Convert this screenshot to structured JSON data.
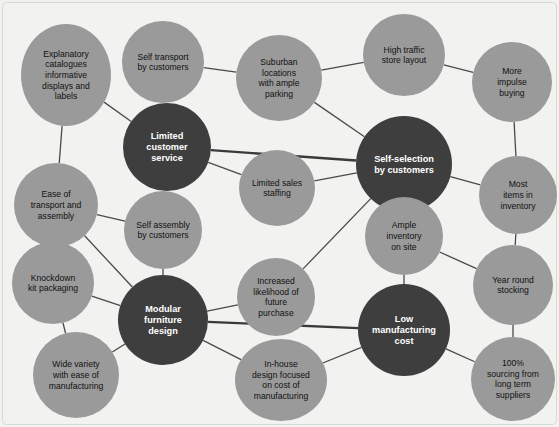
{
  "diagram": {
    "type": "node-link-network",
    "background_color": "#f2f2f0",
    "light_node_color": "#9a9a9a",
    "dark_node_color": "#3e3e3e",
    "light_node_text_color": "#111111",
    "dark_node_text_color": "#ffffff",
    "edge_color": "#4a4a4a",
    "width": 559,
    "height": 427,
    "nodes": [
      {
        "id": "explanatory-catalogues",
        "label": "Explanatory catalogues informative displays and labels",
        "lines": [
          "Explanatory",
          "catalogues",
          "informative",
          "displays and",
          "labels"
        ],
        "kind": "light",
        "shape": "ellipse",
        "cx": 66,
        "cy": 75,
        "rx": 45,
        "ry": 51
      },
      {
        "id": "self-transport",
        "label": "Self transport by customers",
        "lines": [
          "Self transport",
          "by customers"
        ],
        "kind": "light",
        "shape": "circle",
        "cx": 163,
        "cy": 62,
        "rx": 41,
        "ry": 41
      },
      {
        "id": "suburban-locations",
        "label": "Suburban locations with ample parking",
        "lines": [
          "Suburban",
          "locations",
          "with ample",
          "parking"
        ],
        "kind": "light",
        "shape": "circle",
        "cx": 279,
        "cy": 78,
        "rx": 43,
        "ry": 43
      },
      {
        "id": "high-traffic",
        "label": "High traffic store layout",
        "lines": [
          "High traffic",
          "store layout"
        ],
        "kind": "light",
        "shape": "circle",
        "cx": 404,
        "cy": 55,
        "rx": 41,
        "ry": 41
      },
      {
        "id": "more-impulse-buying",
        "label": "More impulse buying",
        "lines": [
          "More",
          "impulse",
          "buying"
        ],
        "kind": "light",
        "shape": "circle",
        "cx": 512,
        "cy": 82,
        "rx": 40,
        "ry": 40
      },
      {
        "id": "limited-customer-service",
        "label": "Limited customer service",
        "lines": [
          "Limited",
          "customer",
          "service"
        ],
        "kind": "dark",
        "shape": "circle",
        "cx": 167,
        "cy": 147,
        "rx": 44,
        "ry": 44
      },
      {
        "id": "self-selection",
        "label": "Self-selection by customers",
        "lines": [
          "Self-selection",
          "by customers"
        ],
        "kind": "dark",
        "shape": "circle",
        "cx": 404,
        "cy": 164,
        "rx": 48,
        "ry": 48
      },
      {
        "id": "ease-of-transport",
        "label": "Ease of transport and assembly",
        "lines": [
          "Ease of",
          "transport and",
          "assembly"
        ],
        "kind": "light",
        "shape": "circle",
        "cx": 56,
        "cy": 205,
        "rx": 42,
        "ry": 42
      },
      {
        "id": "limited-sales-staffing",
        "label": "Limited sales staffing",
        "lines": [
          "Limited sales",
          "staffing"
        ],
        "kind": "light",
        "shape": "circle",
        "cx": 277,
        "cy": 188,
        "rx": 38,
        "ry": 38
      },
      {
        "id": "most-items-inventory",
        "label": "Most items in inventory",
        "lines": [
          "Most",
          "items in",
          "inventory"
        ],
        "kind": "light",
        "shape": "circle",
        "cx": 518,
        "cy": 195,
        "rx": 39,
        "ry": 39
      },
      {
        "id": "self-assembly",
        "label": "Self assembly by customers",
        "lines": [
          "Self assembly",
          "by customers"
        ],
        "kind": "light",
        "shape": "circle",
        "cx": 163,
        "cy": 230,
        "rx": 39,
        "ry": 39
      },
      {
        "id": "ample-inventory",
        "label": "Ample inventory on site",
        "lines": [
          "Ample",
          "inventory",
          "on site"
        ],
        "kind": "light",
        "shape": "circle",
        "cx": 404,
        "cy": 236,
        "rx": 39,
        "ry": 39
      },
      {
        "id": "knockdown-kit",
        "label": "Knockdown kit packaging",
        "lines": [
          "Knockdown",
          "kit packaging"
        ],
        "kind": "light",
        "shape": "circle",
        "cx": 53,
        "cy": 283,
        "rx": 41,
        "ry": 41
      },
      {
        "id": "increased-likelihood",
        "label": "Increased likelihood of future purchase",
        "lines": [
          "Increased",
          "likelihood of",
          "future",
          "purchase"
        ],
        "kind": "light",
        "shape": "circle",
        "cx": 276,
        "cy": 297,
        "rx": 39,
        "ry": 39
      },
      {
        "id": "year-round-stocking",
        "label": "Year round stocking",
        "lines": [
          "Year round",
          "stocking"
        ],
        "kind": "light",
        "shape": "circle",
        "cx": 513,
        "cy": 285,
        "rx": 40,
        "ry": 40
      },
      {
        "id": "modular-furniture-design",
        "label": "Modular furniture design",
        "lines": [
          "Modular",
          "furniture",
          "design"
        ],
        "kind": "dark",
        "shape": "circle",
        "cx": 163,
        "cy": 320,
        "rx": 45,
        "ry": 45
      },
      {
        "id": "low-manufacturing-cost",
        "label": "Low manufacturing cost",
        "lines": [
          "Low",
          "manufacturing",
          "cost"
        ],
        "kind": "dark",
        "shape": "circle",
        "cx": 404,
        "cy": 330,
        "rx": 46,
        "ry": 46
      },
      {
        "id": "wide-variety",
        "label": "Wide variety with ease of manufacturing",
        "lines": [
          "Wide variety",
          "with ease of",
          "manufacturing"
        ],
        "kind": "light",
        "shape": "circle",
        "cx": 76,
        "cy": 375,
        "rx": 43,
        "ry": 43
      },
      {
        "id": "in-house-design",
        "label": "In-house design focused on cost of manufacturing",
        "lines": [
          "In-house",
          "design focused",
          "on cost of",
          "manufacturing"
        ],
        "kind": "light",
        "shape": "ellipse",
        "cx": 281,
        "cy": 380,
        "rx": 46,
        "ry": 41
      },
      {
        "id": "sourcing-long-term",
        "label": "100% sourcing from long term suppliers",
        "lines": [
          "100%",
          "sourcing from",
          "long term",
          "suppliers"
        ],
        "kind": "light",
        "shape": "circle",
        "cx": 513,
        "cy": 379,
        "rx": 42,
        "ry": 42
      }
    ],
    "edges": [
      {
        "from": "explanatory-catalogues",
        "to": "limited-customer-service",
        "weight": "thin"
      },
      {
        "from": "self-transport",
        "to": "limited-customer-service",
        "weight": "thin"
      },
      {
        "from": "self-transport",
        "to": "suburban-locations",
        "weight": "thin"
      },
      {
        "from": "explanatory-catalogues",
        "to": "ease-of-transport",
        "weight": "thin"
      },
      {
        "from": "suburban-locations",
        "to": "high-traffic",
        "weight": "thin"
      },
      {
        "from": "suburban-locations",
        "to": "self-selection",
        "weight": "thin"
      },
      {
        "from": "high-traffic",
        "to": "more-impulse-buying",
        "weight": "thin"
      },
      {
        "from": "more-impulse-buying",
        "to": "most-items-inventory",
        "weight": "thin"
      },
      {
        "from": "limited-customer-service",
        "to": "self-selection",
        "weight": "thick"
      },
      {
        "from": "limited-customer-service",
        "to": "limited-sales-staffing",
        "weight": "thin"
      },
      {
        "from": "limited-customer-service",
        "to": "self-assembly",
        "weight": "thin"
      },
      {
        "from": "limited-sales-staffing",
        "to": "self-selection",
        "weight": "thin"
      },
      {
        "from": "self-selection",
        "to": "most-items-inventory",
        "weight": "thin"
      },
      {
        "from": "self-selection",
        "to": "ample-inventory",
        "weight": "thin"
      },
      {
        "from": "self-selection",
        "to": "increased-likelihood",
        "weight": "thin"
      },
      {
        "from": "ease-of-transport",
        "to": "self-assembly",
        "weight": "thin"
      },
      {
        "from": "ease-of-transport",
        "to": "knockdown-kit",
        "weight": "thin"
      },
      {
        "from": "ease-of-transport",
        "to": "modular-furniture-design",
        "weight": "thin"
      },
      {
        "from": "self-assembly",
        "to": "modular-furniture-design",
        "weight": "thin"
      },
      {
        "from": "most-items-inventory",
        "to": "year-round-stocking",
        "weight": "thin"
      },
      {
        "from": "ample-inventory",
        "to": "year-round-stocking",
        "weight": "thin"
      },
      {
        "from": "ample-inventory",
        "to": "low-manufacturing-cost",
        "weight": "thin"
      },
      {
        "from": "knockdown-kit",
        "to": "modular-furniture-design",
        "weight": "thin"
      },
      {
        "from": "knockdown-kit",
        "to": "wide-variety",
        "weight": "thin"
      },
      {
        "from": "increased-likelihood",
        "to": "modular-furniture-design",
        "weight": "thin"
      },
      {
        "from": "year-round-stocking",
        "to": "sourcing-long-term",
        "weight": "thin"
      },
      {
        "from": "modular-furniture-design",
        "to": "wide-variety",
        "weight": "thin"
      },
      {
        "from": "modular-furniture-design",
        "to": "low-manufacturing-cost",
        "weight": "thick"
      },
      {
        "from": "modular-furniture-design",
        "to": "in-house-design",
        "weight": "thin"
      },
      {
        "from": "in-house-design",
        "to": "low-manufacturing-cost",
        "weight": "thin"
      },
      {
        "from": "low-manufacturing-cost",
        "to": "sourcing-long-term",
        "weight": "thin"
      }
    ]
  }
}
